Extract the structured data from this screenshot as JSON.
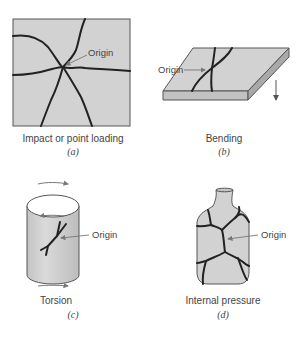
{
  "figure": {
    "panels": [
      {
        "id": "a",
        "caption": "Impact or point loading",
        "sublabel": "(a)",
        "origin_label": "Origin"
      },
      {
        "id": "b",
        "caption": "Bending",
        "sublabel": "(b)",
        "origin_label": "Origin"
      },
      {
        "id": "c",
        "caption": "Torsion",
        "sublabel": "(c)",
        "origin_label": "Origin"
      },
      {
        "id": "d",
        "caption": "Internal pressure",
        "sublabel": "(d)",
        "origin_label": "Origin"
      }
    ],
    "colors": {
      "surface": "#d2d2d2",
      "outline": "#555555",
      "crack": "#222222",
      "text": "#444444"
    }
  }
}
